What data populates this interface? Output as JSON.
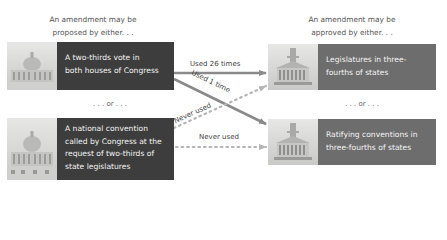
{
  "headings": {
    "proposed": [
      "An amendment may be",
      "proposed by either. . ."
    ],
    "approved": [
      "An amendment may be",
      "approved by either. . ."
    ]
  },
  "separators": {
    "left": ". . . or . . .",
    "right": ". . . or . . ."
  },
  "proposal_methods": [
    {
      "lines": [
        "A two-thirds vote in",
        "both houses of Congress"
      ],
      "image": "us-capitol-icon"
    },
    {
      "lines": [
        "A national convention",
        "called by Congress at the",
        "request of two-thirds of",
        "state legislatures"
      ],
      "image": "us-capitol-icon"
    }
  ],
  "ratification_methods": [
    {
      "lines": [
        "Legislatures in three-",
        "fourths of states"
      ],
      "image": "state-capitol-icon"
    },
    {
      "lines": [
        "Ratifying conventions in",
        "three-fourths of states"
      ],
      "image": "state-capitol-icon"
    }
  ],
  "paths": [
    {
      "from": "congress-vote",
      "to": "state-legislatures",
      "label": "Used 26 times",
      "style": "solid"
    },
    {
      "from": "congress-vote",
      "to": "ratifying-conventions",
      "label": "Used 1 time",
      "style": "solid"
    },
    {
      "from": "national-convention",
      "to": "state-legislatures",
      "label": "Never used",
      "style": "dotted"
    },
    {
      "from": "national-convention",
      "to": "ratifying-conventions",
      "label": "Never used",
      "style": "dotted"
    }
  ],
  "colors": {
    "dark_box": "#3d3d3d",
    "mid_box": "#6d6d6d",
    "solid_arrow": "#8a8a8a",
    "dotted_arrow": "#b5b5b5"
  }
}
